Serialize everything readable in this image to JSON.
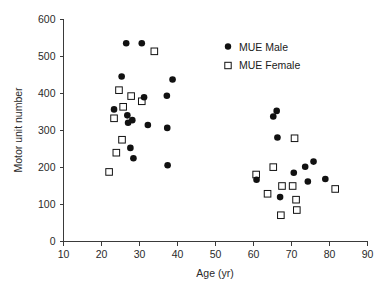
{
  "chart_data": {
    "type": "scatter",
    "title": "",
    "xlabel": "Age (yr)",
    "ylabel": "Motor unit number",
    "xlim": [
      10,
      90
    ],
    "ylim": [
      0,
      600
    ],
    "xticks": [
      10,
      20,
      30,
      40,
      50,
      60,
      70,
      80,
      90
    ],
    "yticks": [
      0,
      100,
      200,
      300,
      400,
      500,
      600
    ],
    "grid": false,
    "legend_position": "upper-right",
    "series": [
      {
        "name": "MUE Male",
        "marker": "filled-circle",
        "color": "#111111",
        "points": [
          [
            23.3,
            357
          ],
          [
            25.3,
            446
          ],
          [
            26.5,
            536
          ],
          [
            26.8,
            341
          ],
          [
            27.0,
            321
          ],
          [
            27.6,
            253
          ],
          [
            28.1,
            328
          ],
          [
            28.4,
            225
          ],
          [
            30.6,
            536
          ],
          [
            31.2,
            390
          ],
          [
            32.2,
            315
          ],
          [
            37.2,
            394
          ],
          [
            37.3,
            307
          ],
          [
            37.4,
            206
          ],
          [
            38.7,
            438
          ],
          [
            60.8,
            167
          ],
          [
            65.2,
            338
          ],
          [
            66.1,
            353
          ],
          [
            66.3,
            281
          ],
          [
            67.0,
            120
          ],
          [
            70.6,
            186
          ],
          [
            73.6,
            202
          ],
          [
            74.3,
            162
          ],
          [
            75.8,
            216
          ],
          [
            78.9,
            169
          ]
        ]
      },
      {
        "name": "MUE Female",
        "marker": "open-square",
        "color": "#111111",
        "points": [
          [
            22.0,
            188
          ],
          [
            23.3,
            333
          ],
          [
            23.9,
            240
          ],
          [
            24.6,
            409
          ],
          [
            25.4,
            275
          ],
          [
            25.7,
            364
          ],
          [
            27.8,
            393
          ],
          [
            30.6,
            379
          ],
          [
            33.9,
            514
          ],
          [
            60.7,
            181
          ],
          [
            63.7,
            129
          ],
          [
            65.2,
            201
          ],
          [
            67.2,
            71
          ],
          [
            67.5,
            150
          ],
          [
            70.3,
            150
          ],
          [
            70.8,
            279
          ],
          [
            71.2,
            113
          ],
          [
            71.4,
            85
          ],
          [
            81.5,
            142
          ]
        ]
      }
    ]
  },
  "legend": {
    "entries": [
      {
        "label": "MUE Male",
        "marker": "filled-circle"
      },
      {
        "label": "MUE Female",
        "marker": "open-square"
      }
    ]
  },
  "axes": {
    "x_title": "Age (yr)",
    "y_title": "Motor unit number",
    "x_tick_labels": [
      "10",
      "20",
      "30",
      "40",
      "50",
      "60",
      "70",
      "80",
      "90"
    ],
    "y_tick_labels": [
      "0",
      "100",
      "200",
      "300",
      "400",
      "500",
      "600"
    ]
  }
}
